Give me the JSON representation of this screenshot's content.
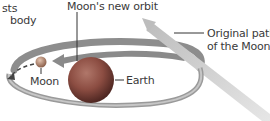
{
  "labels": {
    "partial_left_line1": "sts",
    "partial_left_line2": "body",
    "new_orbit": "Moon's new orbit",
    "original_path_line1": "Original path",
    "original_path_line2": "of the Moon",
    "moon": "Moon",
    "earth": "Earth"
  },
  "colors": {
    "orbit_band": "#8a8a8a",
    "original_path": "#c8c8c8",
    "earth": "#8f4f43",
    "moon": "#b98a70",
    "leader_line": "#333333"
  }
}
